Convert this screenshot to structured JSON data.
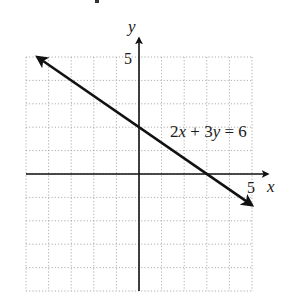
{
  "chart_data": {
    "type": "line",
    "title": "",
    "xlabel": "x",
    "ylabel": "y",
    "xlim": [
      -5,
      5
    ],
    "ylim": [
      -5,
      5
    ],
    "grid": true,
    "grid_style": "dotted",
    "grid_step": 1,
    "x_tick_labels": [
      {
        "value": 5,
        "label": "5"
      }
    ],
    "y_tick_labels": [
      {
        "value": 5,
        "label": "5"
      }
    ],
    "series": [
      {
        "name": "2x + 3y = 6",
        "equation": "2x + 3y = 6",
        "slope": -0.6667,
        "y_intercept": 2,
        "x_intercept": 3,
        "x": [
          -4.5,
          0,
          3,
          5
        ],
        "y": [
          5,
          2,
          0,
          -1.333
        ],
        "arrows_both_ends": true,
        "color": "#111111"
      }
    ],
    "annotations": [
      {
        "text": "2x + 3y = 6",
        "x": 3.8,
        "y": 1.6
      }
    ]
  },
  "labels": {
    "x_axis": "x",
    "y_axis": "y",
    "x_tick": "5",
    "y_tick": "5",
    "equation_parts": [
      "2",
      "x",
      " + 3",
      "y",
      " = 6"
    ]
  },
  "colors": {
    "axis": "#111111",
    "line": "#111111",
    "grid": "#9a9a9a",
    "background": "#ffffff"
  }
}
